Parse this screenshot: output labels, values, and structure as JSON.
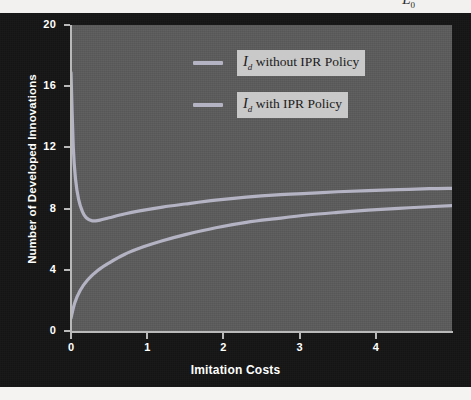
{
  "figure": {
    "clipped_top_symbol": "L",
    "clipped_top_subscript": "0",
    "background_color": "#141414",
    "plot_background_color": "#5a5a5a",
    "axis_color": "#b9b9b9",
    "tick_label_color": "#ffffff"
  },
  "legend": {
    "position": "top-right-inside",
    "entries": [
      {
        "symbol": "I",
        "subscript": "d",
        "text": " without IPR Policy",
        "color": "#b3b3c4"
      },
      {
        "symbol": "I",
        "subscript": "d",
        "text": " with IPR Policy",
        "color": "#b3b3c4"
      }
    ]
  },
  "chart_data": {
    "type": "line",
    "title": "",
    "xlabel": "Imitation Costs",
    "ylabel": "Number of Developed Innovations",
    "xlim": [
      0,
      5
    ],
    "ylim": [
      0,
      20
    ],
    "xticks": [
      0,
      1,
      2,
      3,
      4
    ],
    "yticks": [
      0,
      4,
      8,
      12,
      16,
      20
    ],
    "xtick_labels": [
      "0",
      "1",
      "2",
      "3",
      "4"
    ],
    "ytick_labels": [
      "0",
      "4",
      "8",
      "12",
      "16",
      "20"
    ],
    "grid": false,
    "legend_position": "upper right",
    "series": [
      {
        "name": "I_d without IPR Policy",
        "color": "#b3b3c4",
        "x": [
          0.0,
          0.03,
          0.06,
          0.1,
          0.15,
          0.2,
          0.28,
          0.38,
          0.5,
          0.7,
          0.9,
          1.2,
          1.5,
          1.9,
          2.3,
          2.7,
          3.1,
          3.5,
          3.9,
          4.3,
          4.7,
          5.0
        ],
        "values": [
          16.9,
          12.0,
          9.9,
          8.6,
          7.8,
          7.4,
          7.2,
          7.25,
          7.4,
          7.65,
          7.85,
          8.1,
          8.3,
          8.55,
          8.75,
          8.9,
          9.0,
          9.1,
          9.18,
          9.24,
          9.3,
          9.32
        ]
      },
      {
        "name": "I_d with IPR Policy",
        "color": "#b3b3c4",
        "x": [
          0.0,
          0.05,
          0.12,
          0.22,
          0.35,
          0.5,
          0.7,
          0.95,
          1.2,
          1.5,
          1.9,
          2.3,
          2.7,
          3.1,
          3.5,
          3.9,
          4.3,
          4.7,
          5.0
        ],
        "values": [
          0.85,
          1.85,
          2.65,
          3.35,
          3.95,
          4.45,
          5.0,
          5.5,
          5.9,
          6.3,
          6.75,
          7.1,
          7.35,
          7.58,
          7.75,
          7.9,
          8.02,
          8.12,
          8.2
        ]
      }
    ]
  }
}
